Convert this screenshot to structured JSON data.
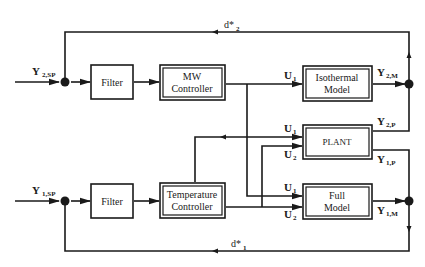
{
  "diagram": {
    "type": "block-diagram",
    "blocks": {
      "filter_top": {
        "label": "Filter"
      },
      "mw_controller": {
        "line1": "MW",
        "line2": "Controller"
      },
      "isothermal_model": {
        "line1": "Isothermal",
        "line2": "Model"
      },
      "plant": {
        "label": "PLANT"
      },
      "filter_bottom": {
        "label": "Filter"
      },
      "temperature_controller": {
        "line1": "Temperature",
        "line2": "Controller"
      },
      "full_model": {
        "line1": "Full",
        "line2": "Model"
      }
    },
    "signals": {
      "y2sp": {
        "main": "Y",
        "sub": "2,SP"
      },
      "y1sp": {
        "main": "Y",
        "sub": "1,SP"
      },
      "d2": {
        "main": "d*",
        "sub": "2"
      },
      "d1": {
        "main": "d*",
        "sub": "1"
      },
      "u1_iso": {
        "main": "U",
        "sub": "1"
      },
      "u1_plant": {
        "main": "U",
        "sub": "1"
      },
      "u2_plant": {
        "main": "U",
        "sub": "2"
      },
      "u1_full": {
        "main": "U",
        "sub": "1"
      },
      "u2_full": {
        "main": "U",
        "sub": "2"
      },
      "y2m": {
        "main": "Y",
        "sub": "2,M"
      },
      "y2p": {
        "main": "Y",
        "sub": "2,P"
      },
      "y1p": {
        "main": "Y",
        "sub": "1,P"
      },
      "y1m": {
        "main": "Y",
        "sub": "1,M"
      }
    }
  }
}
